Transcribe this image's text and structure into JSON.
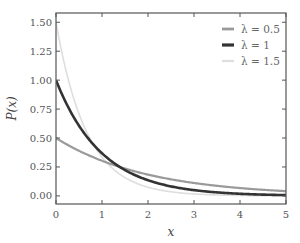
{
  "chart_data": {
    "type": "line",
    "title": "",
    "xlabel": "x",
    "ylabel": "P(x)",
    "xlim": [
      0,
      5
    ],
    "ylim": [
      -0.07,
      1.58
    ],
    "grid": false,
    "legend_position": "upper right",
    "x_ticks": [
      0,
      1,
      2,
      3,
      4,
      5
    ],
    "x_tick_labels": [
      "0",
      "1",
      "2",
      "3",
      "4",
      "5"
    ],
    "y_ticks": [
      0.0,
      0.25,
      0.5,
      0.75,
      1.0,
      1.25,
      1.5
    ],
    "y_tick_labels": [
      "0.00",
      "0.25",
      "0.50",
      "0.75",
      "1.00",
      "1.25",
      "1.50"
    ],
    "function": "P(x) = λ·exp(-λx)",
    "x": [
      0,
      0.5,
      1,
      1.5,
      2,
      2.5,
      3,
      3.5,
      4,
      4.5,
      5
    ],
    "series": [
      {
        "name": "λ = 0.5",
        "lambda": 0.5,
        "color": "#9a9a9a",
        "width": 2.2,
        "values": [
          0.5,
          0.389,
          0.303,
          0.236,
          0.184,
          0.143,
          0.112,
          0.087,
          0.068,
          0.053,
          0.041
        ]
      },
      {
        "name": "λ = 1",
        "lambda": 1.0,
        "color": "#333333",
        "width": 2.6,
        "values": [
          1.0,
          0.607,
          0.368,
          0.223,
          0.135,
          0.082,
          0.05,
          0.03,
          0.018,
          0.011,
          0.007
        ]
      },
      {
        "name": "λ = 1.5",
        "lambda": 1.5,
        "color": "#dedede",
        "width": 1.6,
        "values": [
          1.5,
          0.709,
          0.335,
          0.158,
          0.075,
          0.035,
          0.017,
          0.008,
          0.004,
          0.002,
          0.001
        ]
      }
    ]
  },
  "layout": {
    "plot_left": 56,
    "plot_top": 13,
    "plot_right": 286,
    "plot_bottom": 204,
    "frame_color": "#555555"
  }
}
